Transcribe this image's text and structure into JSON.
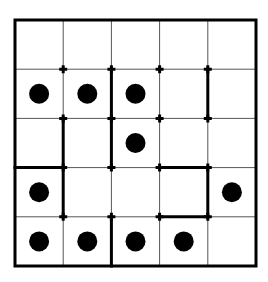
{
  "puzzle": {
    "rows": 5,
    "cols": 5,
    "origin": {
      "x": 15,
      "y": 20
    },
    "cell_w": 48.2,
    "cell_h": 49.2,
    "colors": {
      "grid_line": "#555555",
      "wall": "#000000",
      "dot": "#000000",
      "background": "#ffffff"
    },
    "dots": [
      [
        1,
        0
      ],
      [
        1,
        1
      ],
      [
        1,
        2
      ],
      [
        2,
        2
      ],
      [
        3,
        0
      ],
      [
        3,
        4
      ],
      [
        4,
        0
      ],
      [
        4,
        1
      ],
      [
        4,
        2
      ],
      [
        4,
        3
      ]
    ],
    "walls": [
      {
        "orient": "v",
        "col": 2,
        "row": 1
      },
      {
        "orient": "v",
        "col": 4,
        "row": 1
      },
      {
        "orient": "v",
        "col": 1,
        "row": 2
      },
      {
        "orient": "v",
        "col": 2,
        "row": 2
      },
      {
        "orient": "h",
        "row": 3,
        "col": 0
      },
      {
        "orient": "v",
        "col": 1,
        "row": 3
      },
      {
        "orient": "h",
        "row": 3,
        "col": 3
      },
      {
        "orient": "v",
        "col": 4,
        "row": 3
      },
      {
        "orient": "h",
        "row": 4,
        "col": 3
      },
      {
        "orient": "v",
        "col": 2,
        "row": 4
      }
    ],
    "markers": [
      [
        1,
        1
      ],
      [
        1,
        2
      ],
      [
        1,
        3
      ],
      [
        1,
        4
      ],
      [
        2,
        1
      ],
      [
        2,
        2
      ],
      [
        2,
        3
      ],
      [
        2,
        4
      ],
      [
        3,
        1
      ],
      [
        3,
        2
      ],
      [
        3,
        3
      ],
      [
        3,
        4
      ],
      [
        4,
        1
      ],
      [
        4,
        2
      ],
      [
        4,
        3
      ],
      [
        4,
        4
      ]
    ]
  }
}
